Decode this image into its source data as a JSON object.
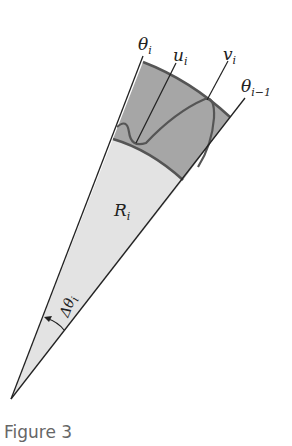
{
  "figure": {
    "caption": "Figure 3",
    "labels": {
      "theta_i": {
        "main": "θ",
        "sub": "i"
      },
      "u_i": {
        "main": "u",
        "sub": "i"
      },
      "v_i": {
        "main": "v",
        "sub": "i"
      },
      "theta_i_minus_1": {
        "main": "θ",
        "sub": "i−1"
      },
      "R_i": {
        "main": "R",
        "sub": "i"
      },
      "delta_theta_i": {
        "main": "Δθ",
        "sub": "i"
      }
    },
    "colors": {
      "outer_band": "#a6a6a6",
      "inner_sector": "#e3e3e3",
      "edges": "#222222",
      "curves": "#555555"
    }
  }
}
